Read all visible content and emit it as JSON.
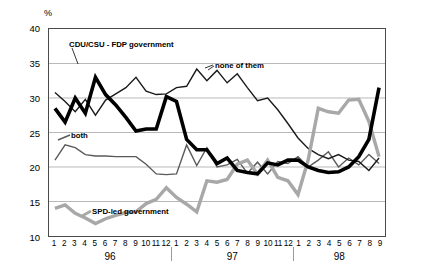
{
  "chart_data": {
    "type": "line",
    "title": "",
    "subtitle": "",
    "xlabel": "",
    "ylabel": "%",
    "ylim": [
      10,
      40
    ],
    "yticks": [
      10,
      15,
      20,
      25,
      30,
      35,
      40
    ],
    "grid": true,
    "legend_position": "inline-annotations",
    "x_axis_note": "monthly polls, 1996 m1 - 1998 m9",
    "categories": [
      "1:96",
      "2:96",
      "3:96",
      "4:96",
      "5:96",
      "6:96",
      "7:96",
      "8:96",
      "9:96",
      "10:96",
      "11:96",
      "12:96",
      "1:97",
      "2:97",
      "3:97",
      "4:97",
      "5:97",
      "6:97",
      "7:97",
      "8:97",
      "9:97",
      "10:97",
      "11:97",
      "12:97",
      "1:98",
      "2:98",
      "3:98",
      "4:98",
      "5:98",
      "6:98",
      "7:98",
      "8:98",
      "9:98"
    ],
    "tick_labels": [
      "1",
      "2",
      "3",
      "4",
      "5",
      "6",
      "7",
      "8",
      "9",
      "10",
      "11",
      "12",
      "1",
      "2",
      "3",
      "4",
      "5",
      "6",
      "7",
      "8",
      "9",
      "10",
      "11",
      "12",
      "1",
      "2",
      "3",
      "4",
      "5",
      "6",
      "7",
      "8",
      "9"
    ],
    "year_groups": [
      {
        "label": "96",
        "start_index": 0,
        "end_index": 11
      },
      {
        "label": "97",
        "start_index": 12,
        "end_index": 23
      },
      {
        "label": "98",
        "start_index": 24,
        "end_index": 32
      }
    ],
    "series": [
      {
        "name": "CDU/CSU - FDP government",
        "color": "#000000",
        "width": 3.6,
        "values": [
          28.5,
          26.5,
          30.0,
          27.8,
          33.0,
          30.5,
          29.0,
          27.2,
          25.2,
          25.5,
          25.5,
          30.2,
          29.5,
          24.0,
          22.5,
          22.5,
          20.5,
          21.3,
          19.5,
          19.2,
          19.0,
          20.6,
          20.3,
          21.0,
          21.0,
          20.0,
          19.5,
          19.2,
          19.3,
          20.0,
          21.5,
          24.0,
          31.5
        ]
      },
      {
        "name": "none of them",
        "color": "#1a1a1a",
        "width": 1.4,
        "values": [
          30.8,
          29.5,
          28.0,
          29.8,
          27.5,
          29.7,
          30.6,
          31.5,
          33.0,
          31.0,
          30.5,
          30.6,
          31.5,
          31.7,
          34.2,
          32.5,
          34.0,
          32.2,
          33.5,
          31.5,
          29.6,
          30.0,
          28.3,
          26.3,
          24.2,
          22.7,
          21.8,
          21.2,
          21.8,
          21.0,
          20.8,
          19.5,
          21.3
        ]
      },
      {
        "name": "both",
        "color": "#5a5a5a",
        "width": 1.4,
        "values": [
          21.0,
          23.2,
          22.8,
          21.8,
          21.6,
          21.6,
          21.5,
          21.5,
          21.5,
          20.4,
          19.0,
          18.9,
          19.0,
          23.2,
          20.2,
          22.8,
          20.0,
          20.3,
          21.1,
          19.1,
          20.7,
          19.0,
          20.8,
          20.5,
          21.5,
          20.0,
          21.0,
          22.2,
          20.0,
          21.3,
          20.3,
          21.8,
          20.5
        ]
      },
      {
        "name": "SPD-led government",
        "color": "#a8a8a8",
        "width": 3.4,
        "values": [
          14.0,
          14.5,
          13.3,
          12.6,
          11.8,
          12.5,
          13.0,
          13.4,
          13.5,
          14.7,
          15.3,
          17.0,
          15.6,
          14.6,
          13.5,
          18.0,
          17.8,
          18.2,
          20.4,
          21.0,
          19.0,
          21.0,
          18.5,
          18.0,
          16.0,
          21.0,
          28.5,
          28.0,
          27.8,
          29.7,
          29.8,
          26.6,
          21.5
        ]
      }
    ],
    "annotations": [
      {
        "name": "cducsu-fdp-label",
        "text": "CDU/CSU - FDP government"
      },
      {
        "name": "none-of-them-label",
        "text": "none of them"
      },
      {
        "name": "both-label",
        "text": "both"
      },
      {
        "name": "spd-led-label",
        "text": "SPD-led government"
      }
    ]
  }
}
